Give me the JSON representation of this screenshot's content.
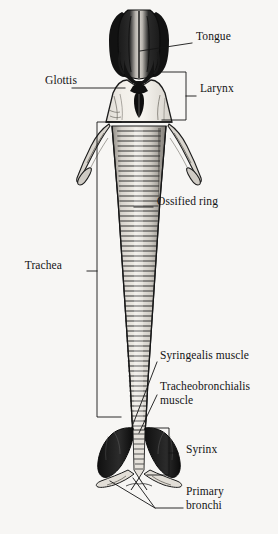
{
  "figure": {
    "background_color": "#f7f6f4",
    "ink_color": "#141414",
    "width": 278,
    "height": 534
  },
  "labels": [
    {
      "id": "tongue",
      "text": "Tongue",
      "x": 196,
      "y": 37,
      "align": "right",
      "leader": "line",
      "leader_kind": "straight",
      "points": [
        [
          140,
          51
        ],
        [
          192,
          43
        ]
      ]
    },
    {
      "id": "glottis",
      "text": "Glottis",
      "x": 31,
      "y": 81,
      "align": "left",
      "leader": "line",
      "leader_kind": "straight",
      "points": [
        [
          72,
          88
        ],
        [
          125,
          88
        ]
      ]
    },
    {
      "id": "larynx",
      "text": "Larynx",
      "x": 200,
      "y": 89,
      "align": "right",
      "leader": "bracket",
      "leader_kind": "square-bracket-right",
      "bracket": {
        "x": 186,
        "top": 72,
        "bottom": 120,
        "arm": 24,
        "tick_y": 96,
        "tick_len": 10
      }
    },
    {
      "id": "ossified-ring",
      "text": "Ossified ring",
      "x": 157,
      "y": 202,
      "align": "right",
      "leader": "line",
      "leader_kind": "straight",
      "points": [
        [
          134,
          207
        ],
        [
          153,
          207
        ]
      ]
    },
    {
      "id": "trachea",
      "text": "Trachea",
      "x": 16,
      "y": 266,
      "align": "left",
      "leader": "bracket",
      "leader_kind": "square-bracket-left",
      "bracket": {
        "x": 97,
        "top": 122,
        "bottom": 417,
        "arm": 24,
        "tick_y": 271,
        "tick_len": 10
      }
    },
    {
      "id": "syringealis-muscle",
      "text": "Syringealis muscle",
      "x": 160,
      "y": 356,
      "align": "right",
      "leader": "line",
      "leader_kind": "straight",
      "points": [
        [
          130,
          432
        ],
        [
          157,
          362
        ]
      ]
    },
    {
      "id": "tracheobronchialis-muscle",
      "text": "Tracheobronchialis\nmuscle",
      "x": 160,
      "y": 387,
      "align": "right",
      "leader": "line",
      "leader_kind": "straight",
      "points": [
        [
          139,
          433
        ],
        [
          157,
          395
        ]
      ]
    },
    {
      "id": "syrinx",
      "text": "Syrinx",
      "x": 186,
      "y": 450,
      "align": "right",
      "leader": "bracket",
      "leader_kind": "square-bracket-right",
      "bracket": {
        "x": 169,
        "top": 428,
        "bottom": 475,
        "arm": 22,
        "tick_y": 453,
        "tick_len": 9
      }
    },
    {
      "id": "primary-bronchi",
      "text": "Primary\nbronchi",
      "x": 186,
      "y": 492,
      "align": "right",
      "leader": "line",
      "leader_kind": "converging-pair",
      "points": [
        [
          110,
          481
        ],
        [
          155,
          508
        ],
        [
          183,
          508
        ]
      ],
      "points2": [
        [
          133,
          478
        ],
        [
          155,
          508
        ]
      ]
    }
  ],
  "structures": [
    {
      "id": "tongue-body",
      "name": "tongue",
      "shading": "dark"
    },
    {
      "id": "larynx-body",
      "name": "larynx",
      "shading": "light"
    },
    {
      "id": "glottis-slit",
      "name": "glottis",
      "shading": "dark"
    },
    {
      "id": "laryngeal-horn-left",
      "name": "left laryngeal process",
      "shading": "outline"
    },
    {
      "id": "laryngeal-horn-right",
      "name": "right laryngeal process",
      "shading": "outline"
    },
    {
      "id": "trachea-tube",
      "name": "trachea with ossified rings",
      "shading": "ringed"
    },
    {
      "id": "syrinx-lobe-left",
      "name": "left syrinx lobe",
      "shading": "dark"
    },
    {
      "id": "syrinx-lobe-right",
      "name": "right syrinx lobe",
      "shading": "dark"
    },
    {
      "id": "bronchus-left",
      "name": "left primary bronchus",
      "shading": "outline"
    },
    {
      "id": "bronchus-right",
      "name": "right primary bronchus",
      "shading": "outline"
    }
  ]
}
